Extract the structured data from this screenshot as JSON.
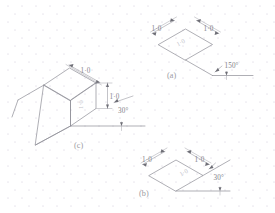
{
  "canvas": {
    "width": 275,
    "height": 213,
    "background": "#ffffff"
  },
  "style": {
    "object_line_color": "#8d8d95",
    "dimension_line_color": "#9a9aa2",
    "extension_line_color": "#a8a8b0",
    "arrow_color": "#6e6e76",
    "text_color": "#8a8a92",
    "grid_dot_color": "#e9e6ee"
  },
  "background": {
    "type": "isometric-dot-grid",
    "dot_spacing_x": 14,
    "dot_spacing_y": 16,
    "row_offset_x": 7
  },
  "figures": [
    {
      "id": "a",
      "caption": "(a)",
      "description": "isometric rhombus face with two 1.0 dimensions and a 150 degree angle",
      "dimensions": [
        {
          "label": "1·0",
          "position": "upper-left"
        },
        {
          "label": "1·0",
          "position": "upper-right"
        }
      ],
      "angle": {
        "label": "150°"
      },
      "inner_label": "1·0"
    },
    {
      "id": "b",
      "caption": "(b)",
      "description": "isometric rhombus face with two 1.0 dimensions and a 30 degree angle",
      "dimensions": [
        {
          "label": "1·0",
          "position": "upper-left"
        },
        {
          "label": "1·0",
          "position": "upper-right"
        }
      ],
      "angle": {
        "label": "30°"
      },
      "inner_label": "1·0"
    },
    {
      "id": "c",
      "caption": "(c)",
      "description": "isometric wedge solid with 1.0 dimensions and a 30 degree reference angle",
      "dimensions": [
        {
          "label": "1·0",
          "position": "top"
        },
        {
          "label": "1·0",
          "position": "right-vertical"
        }
      ],
      "angle": {
        "label": "30°"
      },
      "inner_label": "1·0"
    }
  ]
}
